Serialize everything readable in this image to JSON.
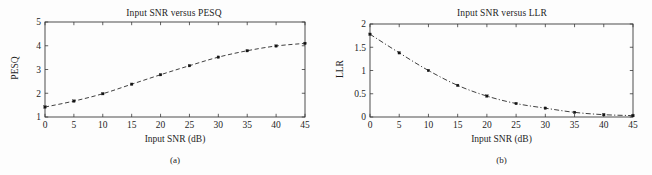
{
  "figure": {
    "panels": [
      {
        "caption": "(a)",
        "title": "Input SNR versus PESQ",
        "xlabel": "Input SNR (dB)",
        "ylabel": "PESQ"
      },
      {
        "caption": "(b)",
        "title": "Input SNR versus LLR",
        "xlabel": "Input SNR (dB)",
        "ylabel": "LLR"
      }
    ]
  },
  "chart_data": [
    {
      "type": "line",
      "title": "Input SNR versus PESQ",
      "xlabel": "Input SNR (dB)",
      "ylabel": "PESQ",
      "x": [
        0,
        5,
        10,
        15,
        20,
        25,
        30,
        35,
        40,
        45
      ],
      "values": [
        1.42,
        1.67,
        1.98,
        2.38,
        2.78,
        3.16,
        3.52,
        3.79,
        3.99,
        4.1
      ],
      "xlim": [
        0,
        45
      ],
      "ylim": [
        1,
        5
      ],
      "xticks": [
        0,
        5,
        10,
        15,
        20,
        25,
        30,
        35,
        40,
        45
      ],
      "yticks": [
        1,
        2,
        3,
        4,
        5
      ],
      "xticklabels": [
        "0",
        "5",
        "10",
        "15",
        "20",
        "25",
        "30",
        "35",
        "40",
        "45"
      ],
      "yticklabels": [
        "1",
        "2",
        "3",
        "4",
        "5"
      ],
      "linestyle": "dashed",
      "marker": "square",
      "color": "#2a2a2a",
      "grid": false,
      "legend": false
    },
    {
      "type": "line",
      "title": "Input SNR versus LLR",
      "xlabel": "Input SNR (dB)",
      "ylabel": "LLR",
      "x": [
        0,
        5,
        10,
        15,
        20,
        25,
        30,
        35,
        40,
        45
      ],
      "values": [
        1.78,
        1.38,
        1.0,
        0.68,
        0.45,
        0.29,
        0.19,
        0.1,
        0.05,
        0.03
      ],
      "xlim": [
        0,
        45
      ],
      "ylim": [
        0,
        2
      ],
      "xticks": [
        0,
        5,
        10,
        15,
        20,
        25,
        30,
        35,
        40,
        45
      ],
      "yticks": [
        0,
        0.5,
        1,
        1.5,
        2
      ],
      "xticklabels": [
        "0",
        "5",
        "10",
        "15",
        "20",
        "25",
        "30",
        "35",
        "40",
        "45"
      ],
      "yticklabels": [
        "0",
        "0.5",
        "1",
        "1.5",
        "2"
      ],
      "linestyle": "dashdot",
      "marker": "square",
      "color": "#2a2a2a",
      "grid": false,
      "legend": false
    }
  ]
}
